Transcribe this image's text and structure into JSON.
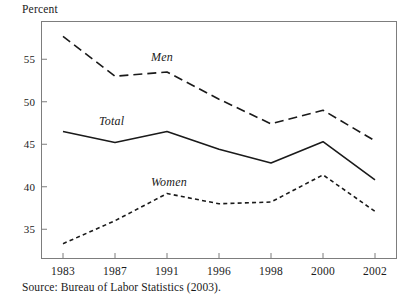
{
  "axis_title": "Percent",
  "source_note": "Source: Bureau of Labor Statistics (2003).",
  "labels": {
    "men": "Men",
    "total": "Total",
    "women": "Women"
  },
  "chart_data": {
    "type": "line",
    "title": "",
    "subtitle": "",
    "xlabel": "",
    "ylabel": "Percent",
    "grid": false,
    "legend_position": "inline-annotations",
    "categories": [
      "1983",
      "1987",
      "1991",
      "1996",
      "1998",
      "2000",
      "2002"
    ],
    "x_tick_labels": [
      "1983",
      "1987",
      "1991",
      "1996",
      "1998",
      "2000",
      "2002"
    ],
    "y_tick_labels": [
      "35",
      "40",
      "45",
      "50",
      "55"
    ],
    "y_ticks": [
      35,
      40,
      45,
      50,
      55
    ],
    "ylim": [
      31.5,
      59.5
    ],
    "series": [
      {
        "name": "Men",
        "style": "long-dash",
        "color": "#1a1a1a",
        "values": [
          57.7,
          53.0,
          53.5,
          50.3,
          47.4,
          49.0,
          45.4
        ]
      },
      {
        "name": "Total",
        "style": "solid",
        "color": "#1a1a1a",
        "values": [
          46.5,
          45.2,
          46.5,
          44.4,
          42.8,
          45.3,
          40.8
        ]
      },
      {
        "name": "Women",
        "style": "short-dash",
        "color": "#1a1a1a",
        "values": [
          33.3,
          36.0,
          39.2,
          38.0,
          38.2,
          41.4,
          37.1
        ]
      }
    ],
    "annotations": [
      {
        "text": "Men",
        "x": "1991",
        "y": 55.2
      },
      {
        "text": "Total",
        "x": "1987",
        "y": 47.6
      },
      {
        "text": "Women",
        "x": "1991",
        "y": 40.4
      }
    ]
  },
  "colors": {
    "ink": "#1a1a1a",
    "frame": "#7d7d7d",
    "background": "#ffffff"
  }
}
